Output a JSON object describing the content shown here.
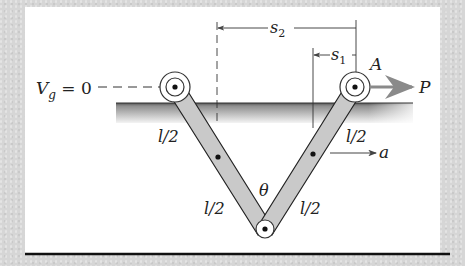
{
  "diagram": {
    "labels": {
      "datum": "V",
      "datum_sub": "g",
      "datum_eq": " = 0",
      "s2": "s",
      "s2_sub": "2",
      "s1": "s",
      "s1_sub": "1",
      "point_A": "A",
      "force_P": "P",
      "accel_a": "a",
      "angle": "θ",
      "len_left_upper": "l/2",
      "len_left_lower": "l/2",
      "len_right_upper": "l/2",
      "len_right_lower": "l/2"
    },
    "colors": {
      "frame": "#d6d6d6",
      "panel": "#ffffff",
      "bar_fill": "#c8c8c8",
      "ground_top": "#555555",
      "ground_fade": "#f0f0f0",
      "arrow_P": "#8a8a8a",
      "ink": "#222222"
    }
  }
}
